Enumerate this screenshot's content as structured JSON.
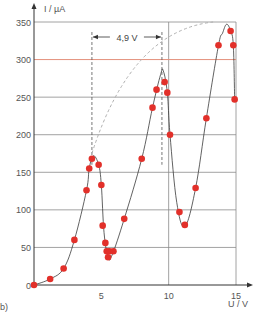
{
  "panel_label": "b)",
  "colors": {
    "grid": "#8a8a8a",
    "reference_line": "#e4907c",
    "curve": "#3a3a3a",
    "points": "#e2302a",
    "envelope_dashed": "#b0b0b0",
    "vline_dashed": "#555555"
  },
  "chart_data": {
    "type": "scatter",
    "title": "",
    "xlabel": "U / V",
    "ylabel": "I / µA",
    "xlim": [
      0,
      15
    ],
    "ylim": [
      0,
      350
    ],
    "xticks": [
      5,
      10,
      15
    ],
    "yticks": [
      0,
      50,
      100,
      150,
      200,
      250,
      300,
      350
    ],
    "grid": true,
    "legend": null,
    "reference_line": {
      "y": 300,
      "color": "#e4907c"
    },
    "annotations": [
      {
        "text": "4,9 V",
        "type": "double-arrow",
        "x_from": 4.3,
        "x_to": 9.5,
        "y": 330
      },
      {
        "type": "dashed-vertical",
        "x": 4.3
      },
      {
        "type": "dashed-vertical",
        "x": 9.5
      },
      {
        "type": "dashed-envelope-curve",
        "from": [
          4.3,
          175
        ],
        "to": [
          13.3,
          350
        ]
      }
    ],
    "series": [
      {
        "name": "measured points",
        "x": [
          0.0,
          1.2,
          2.2,
          3.0,
          3.9,
          4.1,
          4.3,
          4.8,
          5.0,
          5.1,
          5.3,
          5.4,
          5.5,
          5.6,
          5.9,
          6.7,
          8.0,
          8.8,
          9.1,
          9.7,
          9.9,
          10.1,
          10.8,
          11.2,
          12.0,
          12.8,
          13.7,
          14.6,
          14.8,
          14.9
        ],
        "y": [
          0,
          8,
          22,
          60,
          126,
          155,
          168,
          160,
          133,
          79,
          56,
          45,
          37,
          45,
          45,
          88,
          168,
          236,
          260,
          270,
          256,
          200,
          97,
          80,
          129,
          222,
          319,
          338,
          319,
          247
        ]
      },
      {
        "name": "fit curve",
        "x": [
          0.0,
          1.2,
          2.2,
          3.0,
          3.9,
          4.1,
          4.4,
          4.8,
          5.0,
          5.2,
          5.5,
          5.8,
          6.7,
          8.0,
          8.8,
          9.4,
          9.6,
          9.9,
          10.1,
          10.6,
          11.2,
          12.0,
          12.8,
          13.7,
          14.0,
          14.3,
          14.6,
          14.8,
          14.9
        ],
        "y": [
          0,
          8,
          22,
          60,
          126,
          155,
          172,
          160,
          133,
          70,
          37,
          40,
          88,
          168,
          236,
          280,
          285,
          256,
          200,
          110,
          78,
          129,
          222,
          319,
          335,
          347,
          338,
          319,
          247
        ]
      }
    ]
  }
}
